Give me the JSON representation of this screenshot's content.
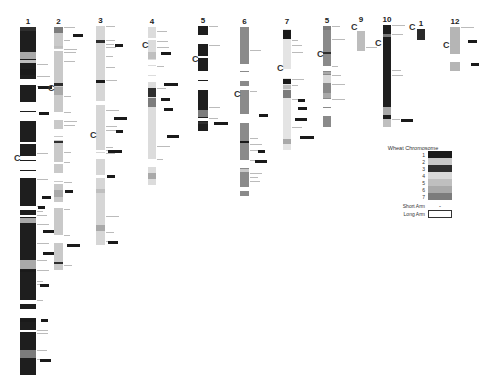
{
  "figure": {
    "type": "wheat chromosome linkage map comparison",
    "centromere_label": "C"
  },
  "chromosomes": [
    {
      "label": "1",
      "x": 20,
      "top": 27,
      "bottom": 375,
      "w": 16,
      "fill": "#1e1e1e",
      "cen_y": 158,
      "cen_x": 14
    },
    {
      "label": "2",
      "x": 54,
      "top": 27,
      "bottom": 270,
      "w": 9,
      "fill": "#c9c9c9",
      "cen_y": 88,
      "cen_x": 48
    },
    {
      "label": "3",
      "x": 96,
      "top": 26,
      "bottom": 245,
      "w": 9,
      "fill": "#d6d6d6",
      "cen_y": 135,
      "cen_x": 90
    },
    {
      "label": "4",
      "x": 148,
      "top": 27,
      "bottom": 185,
      "w": 8,
      "fill": "#dcdcdc",
      "cen_y": 45,
      "cen_x": 142
    },
    {
      "label": "5",
      "x": 198,
      "top": 26,
      "bottom": 131,
      "w": 10,
      "fill": "#1e1e1e",
      "cen_y": 59,
      "cen_x": 192
    },
    {
      "label": "6",
      "x": 240,
      "top": 27,
      "bottom": 202,
      "w": 9,
      "fill": "#8a8a8a",
      "cen_y": 94,
      "cen_x": 234
    },
    {
      "label": "7",
      "x": 283,
      "top": 27,
      "bottom": 150,
      "w": 8,
      "fill": "#e4e4e4",
      "cen_y": 68,
      "cen_x": 277
    },
    {
      "label": "5",
      "x": 323,
      "top": 26,
      "bottom": 127,
      "w": 8,
      "fill": "#8a8a8a",
      "cen_y": 54,
      "cen_x": 317
    },
    {
      "label": "9",
      "x": 357,
      "top": 25,
      "bottom": 51,
      "w": 8,
      "fill": "#bdbdbd",
      "cen_y": 27,
      "cen_x": 351
    },
    {
      "label": "10",
      "x": 383,
      "top": 25,
      "bottom": 127,
      "w": 8,
      "fill": "#1e1e1e",
      "cen_y": 43,
      "cen_x": 375
    },
    {
      "label": "1",
      "x": 417,
      "top": 29,
      "bottom": 40,
      "w": 8,
      "fill": "#2a2a2a",
      "cen_y": 27,
      "cen_x": 409
    },
    {
      "label": "12",
      "x": 450,
      "top": 27,
      "bottom": 71,
      "w": 10,
      "fill": "#b5b5b5",
      "cen_y": 45,
      "cen_x": 443
    }
  ],
  "legend": {
    "title": "Wheat Chromosome",
    "items": [
      {
        "label": "1",
        "color": "#1a1a1a"
      },
      {
        "label": "2",
        "color": "#c8c8c8"
      },
      {
        "label": "3",
        "color": "#2e2e2e"
      },
      {
        "label": "4",
        "color": "#d9d9d9"
      },
      {
        "label": "5",
        "color": "#bfbfbf"
      },
      {
        "label": "6",
        "color": "#a9a9a9"
      },
      {
        "label": "7",
        "color": "#7c7c7c"
      }
    ],
    "short_arm_label": "Short Arm",
    "short_arm_symbol": "-",
    "long_arm_label": "Long Arm"
  }
}
